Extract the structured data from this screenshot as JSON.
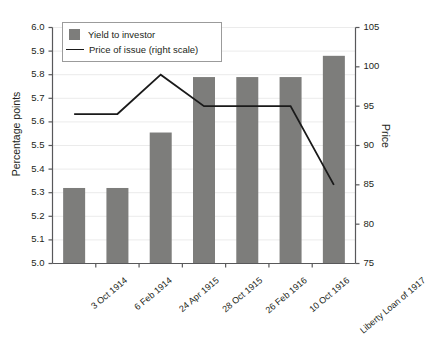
{
  "chart_data": {
    "type": "bar",
    "title": "",
    "categories": [
      "3 Oct 1914",
      "6 Feb 1914",
      "24 Apr 1915",
      "28 Oct 1915",
      "26 Feb 1916",
      "10 Oct 1916",
      "Liberty Loan of 1917"
    ],
    "series": [
      {
        "name": "Yield to investor",
        "type": "bar",
        "axis": "left",
        "values": [
          5.32,
          5.32,
          5.555,
          5.79,
          5.79,
          5.79,
          5.88
        ],
        "color": "#7d7d7b"
      },
      {
        "name": "Price of issue (right scale)",
        "type": "line",
        "axis": "right",
        "values": [
          94,
          94,
          99,
          95,
          95,
          95,
          85
        ],
        "color": "#1a1a1a"
      }
    ],
    "xlabel": "",
    "ylabel": "Percentage points",
    "ylabel_right": "Price",
    "ylim": [
      5.0,
      6.0
    ],
    "yticks": [
      "5.0",
      "5.1",
      "5.2",
      "5.3",
      "5.4",
      "5.5",
      "5.6",
      "5.7",
      "5.8",
      "5.9",
      "6.0"
    ],
    "ylim_right": [
      75,
      105
    ],
    "yticks_right": [
      "75",
      "80",
      "85",
      "90",
      "95",
      "100",
      "105"
    ],
    "grid": true,
    "legend_position": "top-left",
    "legend": [
      "Yield to investor",
      "Price of issue (right scale)"
    ]
  },
  "colors": {
    "bar": "#7d7d7b",
    "line": "#1a1a1a",
    "grid": "#ebebeb",
    "axis": "#58585a",
    "text": "#231f20",
    "background": "#ffffff"
  }
}
